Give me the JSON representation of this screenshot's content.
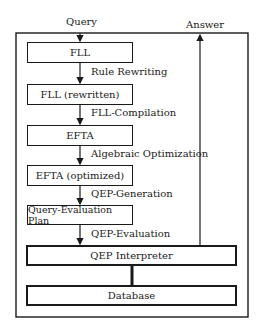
{
  "diagram": {
    "input_label": "Query",
    "output_label": "Answer",
    "stages": [
      {
        "label": "FLL"
      },
      {
        "label": "FLL (rewritten)"
      },
      {
        "label": "EFTA"
      },
      {
        "label": "EFTA (optimized)"
      },
      {
        "label": "Query-Evaluation Plan"
      }
    ],
    "transitions": [
      {
        "label": "Rule Rewriting"
      },
      {
        "label": "FLL-Compilation"
      },
      {
        "label": "Algebraic Optimization"
      },
      {
        "label": "QEP-Generation"
      },
      {
        "label": "QEP-Evaluation"
      }
    ],
    "interpreter": {
      "label": "QEP Interpreter"
    },
    "database": {
      "label": "Database"
    }
  }
}
